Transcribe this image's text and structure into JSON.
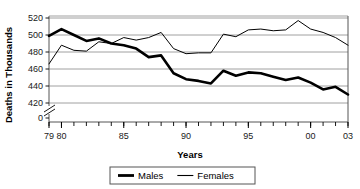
{
  "chart_data": {
    "type": "line",
    "title": "",
    "xlabel": "Years",
    "ylabel": "Deaths in Thousands",
    "ylim": [
      410,
      525
    ],
    "xlim": [
      79,
      103
    ],
    "grid": true,
    "axis_break": true,
    "legend_position": "bottom",
    "y_ticks": [
      "520",
      "500",
      "480",
      "460",
      "440",
      "420",
      "0"
    ],
    "y_tick_values": [
      520,
      500,
      480,
      460,
      440,
      420,
      0
    ],
    "x_ticks": [
      "79",
      "80",
      "85",
      "90",
      "95",
      "00",
      "03"
    ],
    "x_tick_values": [
      79,
      80,
      85,
      90,
      95,
      100,
      103
    ],
    "x": [
      79,
      80,
      81,
      82,
      83,
      84,
      85,
      86,
      87,
      88,
      89,
      90,
      91,
      92,
      93,
      94,
      95,
      96,
      97,
      98,
      99,
      100,
      101,
      102,
      103
    ],
    "series": [
      {
        "name": "Males",
        "style": "thick",
        "color": "#000000",
        "values": [
          499,
          507,
          500,
          493,
          496,
          490,
          488,
          484,
          474,
          476,
          455,
          448,
          446,
          443,
          458,
          452,
          456,
          455,
          451,
          447,
          450,
          444,
          436,
          439,
          430
        ]
      },
      {
        "name": "Females",
        "style": "thin",
        "color": "#000000",
        "values": [
          466,
          488,
          482,
          481,
          492,
          490,
          497,
          494,
          497,
          503,
          484,
          478,
          479,
          479,
          501,
          498,
          506,
          507,
          505,
          506,
          517,
          507,
          503,
          497,
          488
        ]
      }
    ]
  },
  "legend": {
    "items": [
      {
        "label": "Males",
        "style": "thick"
      },
      {
        "label": "Females",
        "style": "thin"
      }
    ]
  }
}
